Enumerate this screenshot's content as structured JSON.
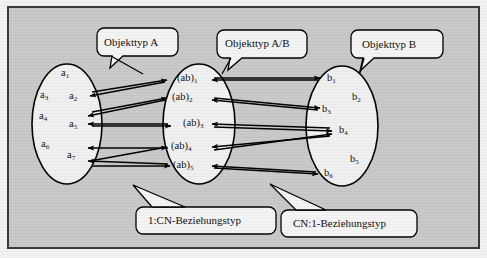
{
  "figure": {
    "background_color": "#c9c9c9",
    "frame_border_color": "#3a3a3a",
    "ellipse_fill": "#f0f0f0",
    "ellipse_stroke": "#000000",
    "callout_fill": "#f4f4f4",
    "callout_stroke": "#000000",
    "arrow_color": "#000000"
  },
  "callouts": [
    {
      "id": "callout-objekttyp-a",
      "label": "Objekttyp A"
    },
    {
      "id": "callout-objekttyp-ab",
      "label": "Objekttyp A/B"
    },
    {
      "id": "callout-objekttyp-b",
      "label": "Objekttyp B"
    },
    {
      "id": "callout-beziehung-1cn",
      "label": "1:CN-Beziehungstyp"
    },
    {
      "id": "callout-beziehung-cn1",
      "label": "CN:1-Beziehungstyp"
    }
  ],
  "entity_sets": {
    "left": {
      "name": "Objekttyp A",
      "members": [
        "a1",
        "a2",
        "a3",
        "a4",
        "a5",
        "a6",
        "a7"
      ],
      "labels": [
        {
          "base": "a",
          "sub": "1"
        },
        {
          "base": "a",
          "sub": "3"
        },
        {
          "base": "a",
          "sub": "2"
        },
        {
          "base": "a",
          "sub": "4"
        },
        {
          "base": "a",
          "sub": "5"
        },
        {
          "base": "a",
          "sub": "6"
        },
        {
          "base": "a",
          "sub": "7"
        }
      ]
    },
    "middle": {
      "name": "Objekttyp A/B",
      "members": [
        "(ab)1",
        "(ab)2",
        "(ab)3",
        "(ab)4",
        "(ab)5"
      ],
      "labels": [
        {
          "base": "(ab)",
          "sub": "1"
        },
        {
          "base": "(ab)",
          "sub": "2"
        },
        {
          "base": "(ab)",
          "sub": "3"
        },
        {
          "base": "(ab)",
          "sub": "4"
        },
        {
          "base": "(ab)",
          "sub": "5"
        }
      ]
    },
    "right": {
      "name": "Objekttyp B",
      "members": [
        "b1",
        "b2",
        "b3",
        "b4",
        "b5",
        "b6"
      ],
      "labels": [
        {
          "base": "b",
          "sub": "1"
        },
        {
          "base": "b",
          "sub": "2"
        },
        {
          "base": "b",
          "sub": "3"
        },
        {
          "base": "b",
          "sub": "4"
        },
        {
          "base": "b",
          "sub": "5"
        },
        {
          "base": "b",
          "sub": "6"
        }
      ]
    }
  },
  "relationships": {
    "left_side": {
      "type": "1:CN-Beziehungstyp",
      "description": "Pfeile zwischen Objekttyp A und Objekttyp A/B"
    },
    "right_side": {
      "type": "CN:1-Beziehungstyp",
      "description": "Pfeile zwischen Objekttyp A/B und Objekttyp B"
    }
  }
}
